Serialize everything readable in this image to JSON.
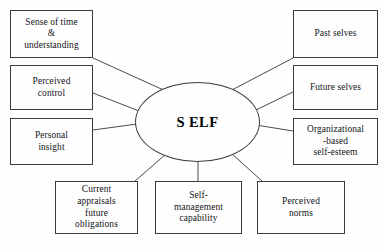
{
  "diagram": {
    "center": {
      "label": "S ELF",
      "shape": "ellipse",
      "x": 135,
      "y": 82,
      "width": 125,
      "height": 80
    },
    "style": {
      "background_color": "#fefefe",
      "border_color": "#3a3a42",
      "text_color": "#14141a",
      "connector_color": "#4a4a52"
    },
    "nodes": [
      {
        "id": "sense-of-time",
        "label": "Sense of time\n&\nunderstanding",
        "x": 10,
        "y": 10,
        "width": 83,
        "height": 48
      },
      {
        "id": "perceived-control",
        "label": "Perceived\ncontrol",
        "x": 10,
        "y": 65,
        "width": 83,
        "height": 45
      },
      {
        "id": "personal-insight",
        "label": "Personal\ninsight",
        "x": 10,
        "y": 118,
        "width": 83,
        "height": 47
      },
      {
        "id": "past-selves",
        "label": "Past selves",
        "x": 293,
        "y": 10,
        "width": 85,
        "height": 48
      },
      {
        "id": "future-selves",
        "label": "Future selves",
        "x": 293,
        "y": 65,
        "width": 85,
        "height": 45
      },
      {
        "id": "organizational-based-self-esteem",
        "label": "Organizational\n-based\nself-esteem",
        "x": 293,
        "y": 118,
        "width": 85,
        "height": 47
      },
      {
        "id": "current-appraisals",
        "label": "Current\nappraisals\nfuture\nobligations",
        "x": 55,
        "y": 181,
        "width": 83,
        "height": 53
      },
      {
        "id": "self-management-capability",
        "label": "Self-\nmanagement\ncapability",
        "x": 155,
        "y": 181,
        "width": 87,
        "height": 53
      },
      {
        "id": "perceived-norms",
        "label": "Perceived\nnorms",
        "x": 257,
        "y": 181,
        "width": 88,
        "height": 53
      }
    ],
    "connectors": [
      {
        "id": "link-sense-of-time",
        "x1": 93,
        "y1": 58,
        "x2": 168,
        "y2": 92
      },
      {
        "id": "link-perceived-control",
        "x1": 93,
        "y1": 93,
        "x2": 139,
        "y2": 111
      },
      {
        "id": "link-personal-insight",
        "x1": 93,
        "y1": 130,
        "x2": 137,
        "y2": 124
      },
      {
        "id": "link-past-selves",
        "x1": 293,
        "y1": 58,
        "x2": 230,
        "y2": 91
      },
      {
        "id": "link-future-selves",
        "x1": 293,
        "y1": 92,
        "x2": 256,
        "y2": 110
      },
      {
        "id": "link-organizational-based-self-esteem",
        "x1": 293,
        "y1": 131,
        "x2": 256,
        "y2": 125
      },
      {
        "id": "link-current-appraisals",
        "x1": 135,
        "y1": 181,
        "x2": 166,
        "y2": 154
      },
      {
        "id": "link-self-management-capability",
        "x1": 198,
        "y1": 181,
        "x2": 198,
        "y2": 162
      },
      {
        "id": "link-perceived-norms",
        "x1": 262,
        "y1": 181,
        "x2": 231,
        "y2": 153
      }
    ]
  }
}
